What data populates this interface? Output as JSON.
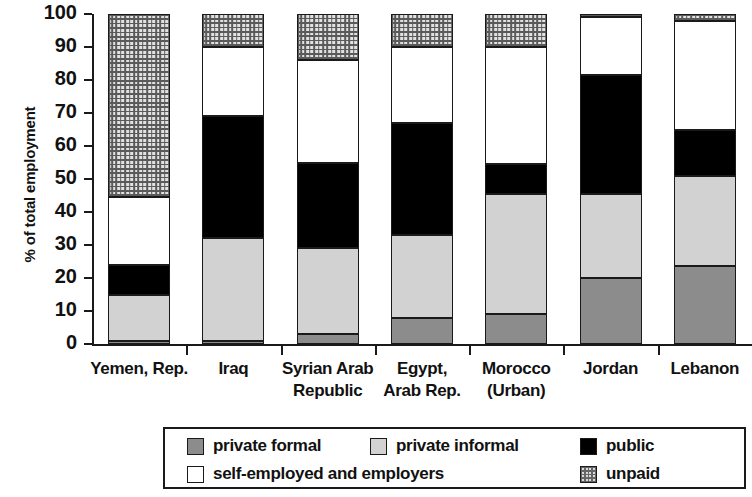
{
  "chart_data": {
    "type": "bar",
    "subtype": "stacked-bar-100-percent",
    "title": "",
    "xlabel": "",
    "ylabel": "% of total employment",
    "ylim": [
      0,
      100
    ],
    "yticks": [
      0,
      10,
      20,
      30,
      40,
      50,
      60,
      70,
      80,
      90,
      100
    ],
    "grid": false,
    "legend_position": "bottom",
    "categories": [
      "Yemen, Rep.",
      "Iraq",
      "Syrian Arab Republic",
      "Egypt, Arab Rep.",
      "Morocco (Urban)",
      "Jordan",
      "Lebanon"
    ],
    "category_lines": [
      [
        "Yemen, Rep.",
        ""
      ],
      [
        "Iraq",
        ""
      ],
      [
        "Syrian Arab",
        "Republic"
      ],
      [
        "Egypt,",
        "Arab Rep."
      ],
      [
        "Morocco",
        "(Urban)"
      ],
      [
        "Jordan",
        ""
      ],
      [
        "Lebanon",
        ""
      ]
    ],
    "series": [
      {
        "name": "private formal",
        "key": "private-formal",
        "color": "#8c8c8c",
        "values": [
          1,
          1,
          3,
          8,
          9,
          20,
          23.5
        ]
      },
      {
        "name": "private informal",
        "key": "private-informal",
        "color": "#d2d2d2",
        "values": [
          14,
          31,
          26,
          25,
          36.5,
          25.5,
          27.5
        ]
      },
      {
        "name": "public",
        "key": "public",
        "color": "#000000",
        "values": [
          9,
          37,
          26,
          34,
          9,
          36,
          14
        ]
      },
      {
        "name": "self-employed and employers",
        "key": "self-employed",
        "color": "#ffffff",
        "values": [
          20.5,
          21,
          31,
          23,
          35.5,
          17.5,
          33
        ]
      },
      {
        "name": "unpaid",
        "key": "unpaid",
        "color": "#e2e2e2",
        "values": [
          55.5,
          10,
          14,
          10,
          10,
          1,
          2
        ]
      }
    ],
    "cumulative_tops": {
      "Yemen, Rep.": [
        1,
        15,
        24,
        44.5,
        100
      ],
      "Iraq": [
        1,
        32,
        69,
        90,
        100
      ],
      "Syrian Arab Republic": [
        3,
        29,
        55,
        86,
        100
      ],
      "Egypt, Arab Rep.": [
        8,
        33,
        67,
        90,
        100
      ],
      "Morocco (Urban)": [
        9,
        45.5,
        54.5,
        90,
        100
      ],
      "Jordan": [
        20,
        45.5,
        81.5,
        99,
        100
      ],
      "Lebanon": [
        23.5,
        51,
        65,
        98,
        100
      ]
    }
  },
  "legend": {
    "items": [
      {
        "label": "private formal",
        "key": "private-formal"
      },
      {
        "label": "private informal",
        "key": "private-informal"
      },
      {
        "label": "public",
        "key": "public"
      },
      {
        "label": "self-employed and employers",
        "key": "self-employed"
      },
      {
        "label": "unpaid",
        "key": "unpaid"
      }
    ]
  }
}
